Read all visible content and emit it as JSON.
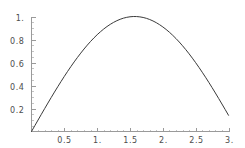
{
  "chart_data": {
    "type": "line",
    "title": "",
    "subtitle": "",
    "xlabel": "",
    "ylabel": "",
    "xlim": [
      0,
      3.0
    ],
    "ylim": [
      0,
      1.0
    ],
    "grid": false,
    "legend": null,
    "legend_position": "none",
    "background_color": "#ffffff",
    "axis_color": "#9a9a9a",
    "curve_color": "#3a3a3a",
    "tick_label_color": "#4d4d4d",
    "xticks": [
      0.5,
      1.0,
      1.5,
      2.0,
      2.5,
      3.0
    ],
    "xtick_labels": [
      "0.5",
      "1.",
      "1.5",
      "2.",
      "2.5",
      "3."
    ],
    "yticks": [
      0.2,
      0.4,
      0.6,
      0.8,
      1.0
    ],
    "ytick_labels": [
      "0.2",
      "0.4",
      "0.6",
      "0.8",
      "1."
    ],
    "x_minor_ticks": [
      0.1,
      0.2,
      0.3,
      0.4,
      0.6,
      0.7,
      0.8,
      0.9,
      1.1,
      1.2,
      1.3,
      1.4,
      1.6,
      1.7,
      1.8,
      1.9,
      2.1,
      2.2,
      2.3,
      2.4,
      2.6,
      2.7,
      2.8,
      2.9
    ],
    "y_minor_ticks": [
      0.05,
      0.1,
      0.15,
      0.25,
      0.3,
      0.35,
      0.45,
      0.5,
      0.55,
      0.65,
      0.7,
      0.75,
      0.85,
      0.9,
      0.95
    ],
    "series": [
      {
        "name": "sin(x)",
        "x": [
          0.0,
          0.05,
          0.1,
          0.15,
          0.2,
          0.25,
          0.3,
          0.35,
          0.4,
          0.45,
          0.5,
          0.55,
          0.6,
          0.65,
          0.7,
          0.75,
          0.8,
          0.85,
          0.9,
          0.95,
          1.0,
          1.05,
          1.1,
          1.15,
          1.2,
          1.25,
          1.3,
          1.35,
          1.4,
          1.45,
          1.5,
          1.55,
          1.6,
          1.65,
          1.7,
          1.75,
          1.8,
          1.85,
          1.9,
          1.95,
          2.0,
          2.05,
          2.1,
          2.15,
          2.2,
          2.25,
          2.3,
          2.35,
          2.4,
          2.45,
          2.5,
          2.55,
          2.6,
          2.65,
          2.7,
          2.75,
          2.8,
          2.85,
          2.9,
          2.95,
          3.0
        ],
        "y": [
          0.0,
          0.04998,
          0.09983,
          0.14944,
          0.19867,
          0.2474,
          0.29552,
          0.3429,
          0.38942,
          0.43497,
          0.47943,
          0.52269,
          0.56464,
          0.60519,
          0.64422,
          0.68164,
          0.71736,
          0.75128,
          0.78333,
          0.81342,
          0.84147,
          0.86742,
          0.89121,
          0.91276,
          0.93204,
          0.94898,
          0.96356,
          0.97572,
          0.98545,
          0.99271,
          0.99749,
          0.99978,
          0.99957,
          0.99687,
          0.99166,
          0.98399,
          0.97385,
          0.96128,
          0.9463,
          0.92896,
          0.9093,
          0.88736,
          0.86321,
          0.8369,
          0.8085,
          0.77807,
          0.74571,
          0.71147,
          0.67546,
          0.63776,
          0.59847,
          0.55768,
          0.5155,
          0.47203,
          0.42738,
          0.38166,
          0.33499,
          0.28748,
          0.23925,
          0.19042,
          0.14112
        ]
      }
    ],
    "peak": {
      "x": 1.5708,
      "y": 1.0
    },
    "endpoint": {
      "x": 3.0,
      "y": 0.14112
    },
    "start_point": {
      "x": 0.0,
      "y": 0.0
    }
  }
}
